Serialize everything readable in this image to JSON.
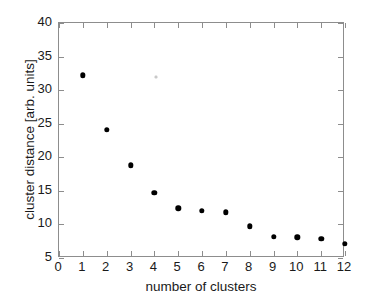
{
  "chart_data": {
    "type": "scatter",
    "title": "",
    "xlabel": "number of clusters",
    "ylabel": "cluster distance [arb. units]",
    "xlim": [
      0,
      12
    ],
    "ylim": [
      5,
      40
    ],
    "xticks": [
      0,
      1,
      2,
      3,
      4,
      5,
      6,
      7,
      8,
      9,
      10,
      11,
      12
    ],
    "xtick_labels": [
      "0",
      "1",
      "2",
      "3",
      "4",
      "5",
      "6",
      "7",
      "8",
      "9",
      "10",
      "11",
      "12"
    ],
    "yticks": [
      5,
      10,
      15,
      20,
      25,
      30,
      35,
      40
    ],
    "ytick_labels": [
      "5",
      "10",
      "15",
      "20",
      "25",
      "30",
      "35",
      "40"
    ],
    "grid": false,
    "legend": null,
    "marker": "filled-circle",
    "marker_color": "#000000",
    "x": [
      1,
      2,
      3,
      4,
      5,
      6,
      7,
      8,
      9,
      10,
      11,
      12
    ],
    "y": [
      32.2,
      24.1,
      18.8,
      14.7,
      12.4,
      12.0,
      11.8,
      9.7,
      8.2,
      8.1,
      7.9,
      7.1
    ],
    "points": [
      {
        "x": 1,
        "y": 32.2
      },
      {
        "x": 2,
        "y": 24.1
      },
      {
        "x": 3,
        "y": 18.8
      },
      {
        "x": 4,
        "y": 14.7
      },
      {
        "x": 5,
        "y": 12.4
      },
      {
        "x": 6,
        "y": 12.0
      },
      {
        "x": 7,
        "y": 11.8
      },
      {
        "x": 8,
        "y": 9.7
      },
      {
        "x": 9,
        "y": 8.2
      },
      {
        "x": 10,
        "y": 8.1
      },
      {
        "x": 11,
        "y": 7.9
      },
      {
        "x": 12,
        "y": 7.1
      }
    ]
  },
  "axes": {
    "frame_color": "#8d8d8d",
    "background": "#ffffff"
  },
  "artifacts": [
    {
      "name": "scan-speck",
      "x": 4.05,
      "y": 32.0,
      "color": "#c9c9c9"
    }
  ]
}
